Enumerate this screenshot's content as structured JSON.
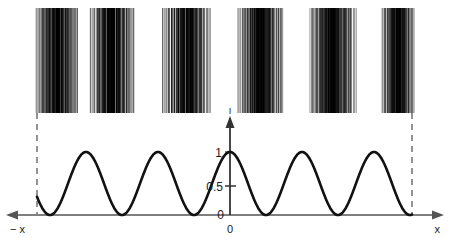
{
  "figure": {
    "title": "",
    "background_color": "#ffffff",
    "width": 450,
    "height": 238
  },
  "axes": {
    "x_axis": {
      "left_label": "− x",
      "right_label": "x",
      "color": "#555555",
      "y_pixel": 215,
      "arrow_both_ends": true
    },
    "y_axis": {
      "top_label": "I",
      "color": "#333333",
      "x_pixel": 230,
      "arrow_top": true,
      "ticks": [
        {
          "label": "1",
          "value": 1,
          "y_pixel": 152
        },
        {
          "label": "0.5",
          "value": 0.5,
          "y_pixel": 186
        },
        {
          "label": "0",
          "value": 0,
          "y_pixel": 215
        }
      ]
    },
    "origin_label": "0"
  },
  "chart_data": {
    "type": "line",
    "title": "",
    "xlabel": "x",
    "ylabel": "I",
    "xlim": [
      -6.28,
      6.28
    ],
    "ylim": [
      0,
      1.15
    ],
    "grid": false,
    "legend": null,
    "annotations": [
      "Vertical dashed drop-lines connect the outermost fringe band edges down to the intensity curve minima."
    ],
    "series": [
      {
        "name": "intensity",
        "formula": "I(x) = cos^2(k x)",
        "period_px": 72,
        "peak_value": 1,
        "trough_value": 0,
        "maxima_x_px": [
          40,
          113,
          185,
          230,
          302,
          375
        ],
        "minima_x_px": [
          41,
          113,
          158,
          194,
          266,
          339,
          411
        ],
        "note": "Raised cosine-squared fringe profile; central maximum at x=0 (pixel 230)."
      }
    ]
  },
  "fringe_bands": {
    "count": 6,
    "top_y": 8,
    "bottom_y": 113,
    "line_color": "#000000",
    "description": "Photographic interference fringe strips (vertical line gratings) above the intensity plot",
    "bands": [
      {
        "index": 1,
        "x_start": 36,
        "x_end": 78,
        "lines": 34,
        "seed": 11
      },
      {
        "index": 2,
        "x_start": 90,
        "x_end": 134,
        "lines": 35,
        "seed": 23
      },
      {
        "index": 3,
        "x_start": 163,
        "x_end": 210,
        "lines": 36,
        "seed": 37
      },
      {
        "index": 4,
        "x_start": 238,
        "x_end": 283,
        "lines": 35,
        "seed": 51
      },
      {
        "index": 5,
        "x_start": 310,
        "x_end": 356,
        "lines": 36,
        "seed": 67
      },
      {
        "index": 6,
        "x_start": 382,
        "x_end": 414,
        "lines": 28,
        "seed": 83
      }
    ]
  },
  "dashed_lines": [
    {
      "name": "left-droplilne",
      "x": 37,
      "y_start": 113,
      "y_end": 214
    },
    {
      "name": "right-dropline",
      "x": 412,
      "y_start": 113,
      "y_end": 214
    }
  ],
  "colors": {
    "curve": "#111111",
    "axis": "#555555",
    "fringe": "#000000",
    "dashed": "#666666",
    "text": "#1a1a1a"
  }
}
